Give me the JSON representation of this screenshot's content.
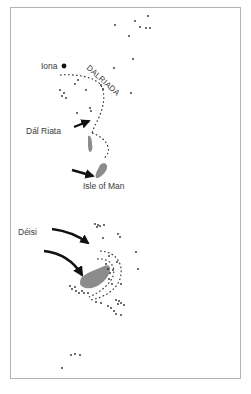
{
  "map": {
    "labels": {
      "iona": "Iona",
      "dalriada": "DALRIADA",
      "dal_riata": "Dál Riata",
      "isle_of_man": "Isle of Man",
      "deisi": "Déisi"
    },
    "colors": {
      "land": "#8c8c8c",
      "dots": "#2a2a2a",
      "arrows": "#111111",
      "frame": "#b4b4b4",
      "text": "#3a3a3a"
    },
    "icons": {
      "iona_marker": "filled-circle",
      "arrows": "curved-arrow"
    }
  }
}
